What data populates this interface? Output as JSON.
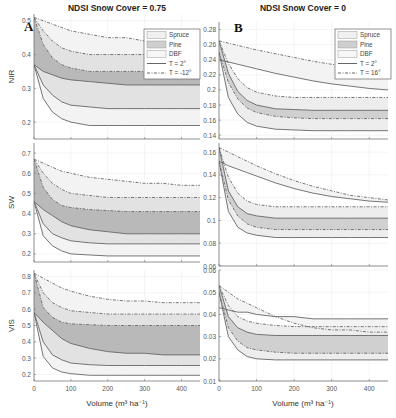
{
  "figure": {
    "columns": [
      {
        "title": "NDSI Snow Cover = 0.75",
        "panel_letter": "A"
      },
      {
        "title": "NDSI Snow Cover = 0"
      }
    ],
    "panel_letters": [
      "A",
      "B"
    ],
    "xlabel": "Volume (m³ ha⁻¹)",
    "legend": {
      "col0": [
        "Spruce",
        "Pine",
        "DBF",
        "T = 2°",
        "T = -12°"
      ],
      "col1": [
        "Spruce",
        "Pine",
        "DBF",
        "T = 2°",
        "T = 16°"
      ]
    }
  },
  "chart_data": [
    {
      "type": "area",
      "title": "NDSI Snow Cover = 0.75",
      "panel": "A-NIR",
      "xlabel": "",
      "ylabel": "NIR",
      "xlim": [
        0,
        450
      ],
      "ylim": [
        0.15,
        0.52
      ],
      "xticks": [
        0,
        100,
        200,
        300,
        400
      ],
      "yticks": [
        0.2,
        0.3,
        0.4,
        0.5
      ],
      "ytick_labels": [
        "0.2",
        "0.3",
        "0.4",
        "0.5"
      ],
      "grid": true,
      "legend_position": "upper right",
      "x": [
        0,
        25,
        50,
        75,
        100,
        150,
        200,
        250,
        300,
        350,
        400,
        450
      ],
      "series": [
        {
          "name": "DBF T=-12° (upper)",
          "values": [
            0.51,
            0.5,
            0.49,
            0.48,
            0.47,
            0.46,
            0.45,
            0.45,
            0.44,
            0.44,
            0.43,
            0.43
          ]
        },
        {
          "name": "Spruce T=-12°",
          "values": [
            0.51,
            0.47,
            0.44,
            0.42,
            0.41,
            0.4,
            0.4,
            0.4,
            0.4,
            0.4,
            0.4,
            0.4
          ]
        },
        {
          "name": "Pine T=-12°",
          "values": [
            0.51,
            0.43,
            0.39,
            0.37,
            0.36,
            0.35,
            0.35,
            0.35,
            0.35,
            0.35,
            0.35,
            0.35
          ]
        },
        {
          "name": "Spruce T=2°",
          "values": [
            0.37,
            0.35,
            0.34,
            0.33,
            0.325,
            0.32,
            0.315,
            0.31,
            0.31,
            0.31,
            0.31,
            0.31
          ]
        },
        {
          "name": "Pine T=2°",
          "values": [
            0.37,
            0.31,
            0.28,
            0.26,
            0.25,
            0.245,
            0.24,
            0.24,
            0.24,
            0.24,
            0.24,
            0.24
          ]
        },
        {
          "name": "DBF T=2° (lower)",
          "values": [
            0.37,
            0.27,
            0.23,
            0.21,
            0.2,
            0.19,
            0.19,
            0.19,
            0.19,
            0.19,
            0.19,
            0.19
          ]
        }
      ]
    },
    {
      "type": "area",
      "title": "NDSI Snow Cover = 0",
      "panel": "B-NIR",
      "xlabel": "",
      "ylabel": "",
      "xlim": [
        0,
        450
      ],
      "ylim": [
        0.135,
        0.29
      ],
      "xticks": [
        0,
        100,
        200,
        300,
        400
      ],
      "yticks": [
        0.14,
        0.16,
        0.18,
        0.2,
        0.22,
        0.24,
        0.26,
        0.28
      ],
      "ytick_labels": [
        "0.14",
        "0.16",
        "0.18",
        "0.2",
        "0.22",
        "0.24",
        "0.26",
        "0.28"
      ],
      "grid": true,
      "legend_position": "upper right",
      "x": [
        0,
        25,
        50,
        75,
        100,
        150,
        200,
        250,
        300,
        350,
        400,
        450
      ],
      "series": [
        {
          "name": "DBF T=16° (upper)",
          "values": [
            0.265,
            0.262,
            0.259,
            0.256,
            0.253,
            0.248,
            0.243,
            0.238,
            0.234,
            0.231,
            0.229,
            0.227
          ]
        },
        {
          "name": "DBF T=2°",
          "values": [
            0.24,
            0.237,
            0.234,
            0.231,
            0.228,
            0.222,
            0.217,
            0.212,
            0.208,
            0.205,
            0.202,
            0.2
          ]
        },
        {
          "name": "Spruce T=16°",
          "values": [
            0.265,
            0.235,
            0.215,
            0.203,
            0.197,
            0.192,
            0.19,
            0.19,
            0.19,
            0.19,
            0.19,
            0.19
          ]
        },
        {
          "name": "Pine T=16°",
          "values": [
            0.265,
            0.222,
            0.198,
            0.186,
            0.18,
            0.175,
            0.174,
            0.173,
            0.173,
            0.173,
            0.173,
            0.173
          ]
        },
        {
          "name": "Spruce T=2°",
          "values": [
            0.25,
            0.21,
            0.188,
            0.176,
            0.17,
            0.165,
            0.163,
            0.162,
            0.162,
            0.162,
            0.162,
            0.162
          ]
        },
        {
          "name": "Pine T=2° (lower)",
          "values": [
            0.25,
            0.19,
            0.168,
            0.157,
            0.152,
            0.148,
            0.147,
            0.146,
            0.146,
            0.146,
            0.146,
            0.146
          ]
        }
      ]
    },
    {
      "type": "area",
      "panel": "A-SW",
      "xlabel": "",
      "ylabel": "SW",
      "xlim": [
        0,
        450
      ],
      "ylim": [
        0.16,
        0.75
      ],
      "xticks": [
        0,
        100,
        200,
        300,
        400
      ],
      "yticks": [
        0.2,
        0.3,
        0.4,
        0.5,
        0.6,
        0.7
      ],
      "ytick_labels": [
        "0.2",
        "0.3",
        "0.4",
        "0.5",
        "0.6",
        "0.7"
      ],
      "grid": true,
      "x": [
        0,
        25,
        50,
        75,
        100,
        150,
        200,
        250,
        300,
        350,
        400,
        450
      ],
      "series": [
        {
          "name": "DBF T=-12° (upper)",
          "values": [
            0.67,
            0.65,
            0.63,
            0.61,
            0.6,
            0.58,
            0.57,
            0.56,
            0.55,
            0.55,
            0.54,
            0.54
          ]
        },
        {
          "name": "Spruce T=-12°",
          "values": [
            0.67,
            0.6,
            0.55,
            0.52,
            0.5,
            0.49,
            0.48,
            0.48,
            0.48,
            0.48,
            0.48,
            0.48
          ]
        },
        {
          "name": "Pine T=-12°",
          "values": [
            0.67,
            0.53,
            0.47,
            0.44,
            0.43,
            0.42,
            0.415,
            0.41,
            0.41,
            0.41,
            0.41,
            0.41
          ]
        },
        {
          "name": "Spruce T=2°",
          "values": [
            0.46,
            0.42,
            0.39,
            0.36,
            0.34,
            0.32,
            0.31,
            0.3,
            0.3,
            0.3,
            0.3,
            0.3
          ]
        },
        {
          "name": "Pine T=2°",
          "values": [
            0.46,
            0.35,
            0.3,
            0.28,
            0.265,
            0.255,
            0.25,
            0.25,
            0.25,
            0.25,
            0.25,
            0.25
          ]
        },
        {
          "name": "DBF T=2° (lower)",
          "values": [
            0.46,
            0.29,
            0.24,
            0.215,
            0.2,
            0.195,
            0.19,
            0.19,
            0.19,
            0.19,
            0.19,
            0.19
          ]
        }
      ]
    },
    {
      "type": "area",
      "panel": "B-SW",
      "xlabel": "",
      "ylabel": "",
      "xlim": [
        0,
        450
      ],
      "ylim": [
        0.06,
        0.168
      ],
      "xticks": [
        0,
        100,
        200,
        300,
        400
      ],
      "yticks": [
        0.06,
        0.08,
        0.1,
        0.12,
        0.14,
        0.16
      ],
      "ytick_labels": [
        "0.06",
        "0.08",
        "0.1",
        "0.12",
        "0.14",
        "0.16"
      ],
      "grid": true,
      "x": [
        0,
        25,
        50,
        75,
        100,
        150,
        200,
        250,
        300,
        350,
        400,
        450
      ],
      "series": [
        {
          "name": "DBF T=16° (upper)",
          "values": [
            0.164,
            0.16,
            0.156,
            0.152,
            0.148,
            0.141,
            0.135,
            0.13,
            0.126,
            0.122,
            0.12,
            0.118
          ]
        },
        {
          "name": "DBF T=2°",
          "values": [
            0.152,
            0.148,
            0.145,
            0.142,
            0.139,
            0.133,
            0.128,
            0.124,
            0.121,
            0.119,
            0.117,
            0.116
          ]
        },
        {
          "name": "Spruce T=16°",
          "values": [
            0.164,
            0.138,
            0.124,
            0.117,
            0.114,
            0.112,
            0.112,
            0.112,
            0.112,
            0.112,
            0.112,
            0.112
          ]
        },
        {
          "name": "Pine T=16°",
          "values": [
            0.164,
            0.126,
            0.112,
            0.106,
            0.104,
            0.102,
            0.102,
            0.102,
            0.102,
            0.102,
            0.102,
            0.102
          ]
        },
        {
          "name": "Spruce T=2°",
          "values": [
            0.152,
            0.118,
            0.104,
            0.097,
            0.094,
            0.092,
            0.092,
            0.092,
            0.092,
            0.092,
            0.092,
            0.092
          ]
        },
        {
          "name": "Pine T=2° (lower)",
          "values": [
            0.152,
            0.108,
            0.094,
            0.089,
            0.087,
            0.085,
            0.085,
            0.085,
            0.085,
            0.085,
            0.085,
            0.085
          ]
        }
      ]
    },
    {
      "type": "area",
      "panel": "A-VIS",
      "xlabel": "Volume (m³ ha⁻¹)",
      "ylabel": "VIS",
      "xlim": [
        0,
        450
      ],
      "ylim": [
        0.16,
        0.84
      ],
      "xticks": [
        0,
        100,
        200,
        300,
        400
      ],
      "xtick_labels": [
        "0",
        "100",
        "200",
        "300",
        "400"
      ],
      "yticks": [
        0.2,
        0.3,
        0.4,
        0.5,
        0.6,
        0.7,
        0.8
      ],
      "ytick_labels": [
        "0.2",
        "0.3",
        "0.4",
        "0.5",
        "0.6",
        "0.7",
        "0.8"
      ],
      "grid": true,
      "x": [
        0,
        25,
        50,
        75,
        100,
        150,
        200,
        250,
        300,
        350,
        400,
        450
      ],
      "series": [
        {
          "name": "DBF T=-12° (upper)",
          "values": [
            0.82,
            0.79,
            0.76,
            0.73,
            0.71,
            0.68,
            0.66,
            0.65,
            0.65,
            0.64,
            0.64,
            0.64
          ]
        },
        {
          "name": "Spruce T=-12°",
          "values": [
            0.82,
            0.7,
            0.64,
            0.61,
            0.59,
            0.58,
            0.57,
            0.57,
            0.57,
            0.57,
            0.57,
            0.57
          ]
        },
        {
          "name": "Pine T=-12°",
          "values": [
            0.82,
            0.61,
            0.55,
            0.52,
            0.51,
            0.505,
            0.5,
            0.5,
            0.5,
            0.5,
            0.5,
            0.5
          ]
        },
        {
          "name": "Spruce T=2°",
          "values": [
            0.58,
            0.52,
            0.47,
            0.42,
            0.39,
            0.36,
            0.34,
            0.33,
            0.33,
            0.32,
            0.32,
            0.32
          ]
        },
        {
          "name": "Pine T=2°",
          "values": [
            0.58,
            0.4,
            0.32,
            0.29,
            0.27,
            0.26,
            0.255,
            0.255,
            0.255,
            0.255,
            0.255,
            0.255
          ]
        },
        {
          "name": "DBF T=2° (lower)",
          "values": [
            0.58,
            0.31,
            0.24,
            0.215,
            0.205,
            0.195,
            0.195,
            0.195,
            0.195,
            0.195,
            0.195,
            0.195
          ]
        }
      ]
    },
    {
      "type": "area",
      "panel": "B-VIS",
      "xlabel": "Volume (m³ ha⁻¹)",
      "ylabel": "",
      "xlim": [
        0,
        450
      ],
      "ylim": [
        0.01,
        0.06
      ],
      "xticks": [
        0,
        100,
        200,
        300,
        400
      ],
      "xtick_labels": [
        "0",
        "100",
        "200",
        "300",
        "400"
      ],
      "yticks": [
        0.01,
        0.02,
        0.03,
        0.04,
        0.05,
        0.06
      ],
      "ytick_labels": [
        "0.01",
        "0.02",
        "0.03",
        "0.04",
        "0.05",
        "0.06"
      ],
      "grid": true,
      "x": [
        0,
        25,
        50,
        75,
        100,
        150,
        200,
        250,
        300,
        350,
        400,
        450
      ],
      "series": [
        {
          "name": "DBF T=16° (upper)",
          "values": [
            0.053,
            0.05,
            0.047,
            0.045,
            0.043,
            0.039,
            0.036,
            0.034,
            0.033,
            0.033,
            0.032,
            0.032
          ]
        },
        {
          "name": "DBF T=2°",
          "values": [
            0.043,
            0.042,
            0.041,
            0.041,
            0.04,
            0.039,
            0.039,
            0.038,
            0.038,
            0.038,
            0.038,
            0.038
          ]
        },
        {
          "name": "Spruce T=16°",
          "values": [
            0.053,
            0.044,
            0.039,
            0.037,
            0.036,
            0.035,
            0.0345,
            0.0345,
            0.0345,
            0.0345,
            0.0345,
            0.0345
          ]
        },
        {
          "name": "Pine T=16°",
          "values": [
            0.053,
            0.039,
            0.034,
            0.032,
            0.031,
            0.0305,
            0.0305,
            0.0305,
            0.0305,
            0.0305,
            0.0305,
            0.0305
          ]
        },
        {
          "name": "Spruce T=2°",
          "values": [
            0.05,
            0.034,
            0.028,
            0.025,
            0.024,
            0.023,
            0.0225,
            0.0225,
            0.0225,
            0.0225,
            0.0225,
            0.0225
          ]
        },
        {
          "name": "Pine T=2° (lower)",
          "values": [
            0.05,
            0.03,
            0.024,
            0.021,
            0.02,
            0.0195,
            0.0195,
            0.0195,
            0.0195,
            0.0195,
            0.0195,
            0.0195
          ]
        }
      ]
    }
  ]
}
